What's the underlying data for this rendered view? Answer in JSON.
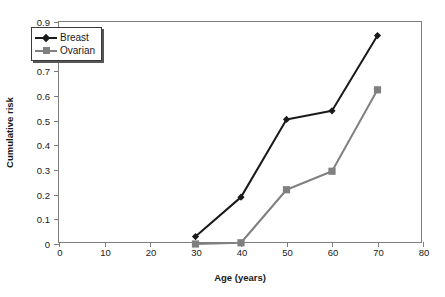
{
  "chart_data": {
    "type": "line",
    "title": "",
    "xlabel": "Age (years)",
    "ylabel": "Cumulative risk",
    "xlim": [
      0,
      80
    ],
    "ylim": [
      0,
      0.9
    ],
    "xticks": [
      "0",
      "10",
      "20",
      "30",
      "40",
      "50",
      "60",
      "70",
      "80"
    ],
    "xtick_values": [
      0,
      10,
      20,
      30,
      40,
      50,
      60,
      70,
      80
    ],
    "yticks": [
      "0",
      "0.1",
      "0.2",
      "0.3",
      "0.4",
      "0.5",
      "0.6",
      "0.7",
      "0.8",
      "0.9"
    ],
    "ytick_values": [
      0,
      0.1,
      0.2,
      0.3,
      0.4,
      0.5,
      0.6,
      0.7,
      0.8,
      0.9
    ],
    "grid": false,
    "legend_position": "upper left inside",
    "x": [
      30,
      40,
      50,
      60,
      70
    ],
    "series": [
      {
        "name": "Breast",
        "values": [
          0.03,
          0.19,
          0.505,
          0.54,
          0.845
        ],
        "color": "#1a1a1a",
        "marker": "diamond"
      },
      {
        "name": "Ovarian",
        "values": [
          0.0,
          0.005,
          0.22,
          0.295,
          0.625
        ],
        "color": "#808080",
        "marker": "square"
      }
    ]
  },
  "legend": {
    "items": [
      {
        "label": "Breast"
      },
      {
        "label": "Ovarian"
      }
    ]
  },
  "colors": {
    "breast": "#1a1a1a",
    "ovarian": "#808080",
    "frame": "#7d7d7d",
    "background": "#ffffff"
  }
}
